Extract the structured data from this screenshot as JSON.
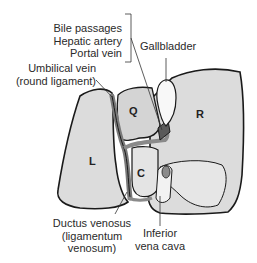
{
  "diagram": {
    "labels": {
      "portal_group": [
        "Bile passages",
        "Hepatic artery",
        "Portal vein"
      ],
      "gallbladder": "Gallbladder",
      "umbilical_vein": [
        "Umbilical vein",
        "(round ligament)"
      ],
      "ductus_venosus": [
        "Ductus venosus",
        "(ligamentum",
        "venosum)"
      ],
      "ivc": [
        "Inferior",
        "vena cava"
      ]
    },
    "lobes": {
      "left": "L",
      "right": "R",
      "quadrate": "Q",
      "caudate": "C"
    },
    "colors": {
      "lobe_fill": "#dcdcdc",
      "lobe_light": "#ececec",
      "outline": "#1a1a1a",
      "vessel": "#8a8a8a",
      "gallbladder": "#f8f8f8"
    }
  }
}
